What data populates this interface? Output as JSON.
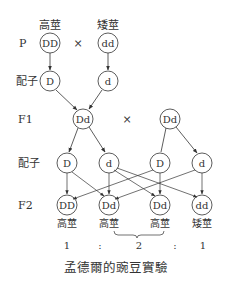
{
  "rows": {
    "p": "P",
    "gamete1": "配子",
    "f1": "F1",
    "gamete2": "配子",
    "f2": "F2"
  },
  "parents": {
    "left": {
      "label": "高莖",
      "genotype": "DD"
    },
    "cross": "×",
    "right": {
      "label": "矮莖",
      "genotype": "dd"
    }
  },
  "parent_gametes": [
    "D",
    "d"
  ],
  "f1": {
    "left": "Dd",
    "cross": "×",
    "right": "Dd"
  },
  "f1_gametes": [
    "D",
    "d",
    "D",
    "d"
  ],
  "f2": [
    {
      "genotype": "DD",
      "phenotype": "高莖"
    },
    {
      "genotype": "Dd",
      "phenotype": "高莖"
    },
    {
      "genotype": "Dd",
      "phenotype": "高莖"
    },
    {
      "genotype": "dd",
      "phenotype": "矮莖"
    }
  ],
  "ratio": {
    "a": "1",
    "sep1": ":",
    "b": "2",
    "sep2": ":",
    "c": "1"
  },
  "caption": "孟德爾的豌豆實驗",
  "colors": {
    "line": "#333333",
    "text": "#333333",
    "background": "#ffffff"
  }
}
